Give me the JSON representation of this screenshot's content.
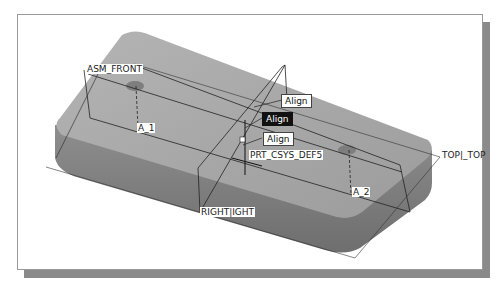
{
  "viewport": {
    "type": "3D CAD assembly view",
    "background": "#ffffff",
    "part_color": "#9a9a9a"
  },
  "datum_planes": [
    {
      "id": "asm_front",
      "label": "ASM_FRONT"
    },
    {
      "id": "top",
      "label": "TOP|_TOP"
    },
    {
      "id": "right",
      "label": "RIGHT|IGHT"
    }
  ],
  "axes": [
    {
      "id": "a1",
      "label": "A_1"
    },
    {
      "id": "a2",
      "label": "A_2"
    }
  ],
  "csys": {
    "label": "PRT_CSYS_DEF5",
    "x_marker": "x",
    "y_marker": "y",
    "z_marker": "z"
  },
  "constraints": [
    {
      "id": "align1",
      "label": "Align",
      "active": false
    },
    {
      "id": "align2",
      "label": "Align",
      "active": true
    },
    {
      "id": "align3",
      "label": "Align",
      "active": false
    }
  ]
}
